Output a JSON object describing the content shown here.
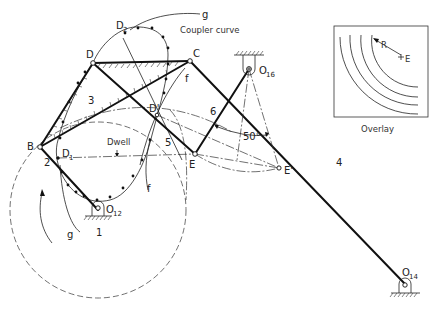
{
  "figure": {
    "labels": {
      "coupler_curve": "Coupler curve",
      "g_top": "g",
      "g_bottom": "g",
      "f_top": "f",
      "f_bottom": "f",
      "dwell": "Dwell",
      "angle": "50°",
      "overlay": "Overlay",
      "overlay_R": "R",
      "overlay_E": "E"
    },
    "points": {
      "B": "B",
      "C": "C",
      "D": "D",
      "D_prime": "D'",
      "D1": "D",
      "D1_sub": "1",
      "D2": "D",
      "D2_sub": "2",
      "E": "E",
      "E_prime": "E'",
      "O12": "O",
      "O12_sub": "12",
      "O14": "O",
      "O14_sub": "14",
      "O16": "O",
      "O16_sub": "16"
    },
    "links": {
      "ground": "1",
      "crank": "2",
      "coupler": "3",
      "rocker": "4",
      "link5": "5",
      "link6": "6"
    },
    "colors": {
      "ink": "#111111",
      "background": "#ffffff"
    }
  }
}
